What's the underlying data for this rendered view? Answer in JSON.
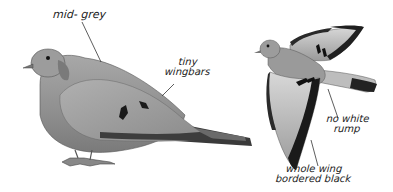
{
  "illustration": {
    "subject": "dove field-guide plate",
    "labels": {
      "mid_grey": "mid- grey",
      "tiny_wingbars_1": "tiny",
      "tiny_wingbars_2": "wingbars",
      "no_white_rump_1": "no white",
      "no_white_rump_2": "rump",
      "whole_wing_1": "whole wing",
      "whole_wing_2": "bordered black"
    },
    "colors": {
      "body_grey": "#9a9a9a",
      "dark_grey": "#5a5a5a",
      "black": "#1a1a1a",
      "light_grey": "#c8c8c8"
    }
  }
}
